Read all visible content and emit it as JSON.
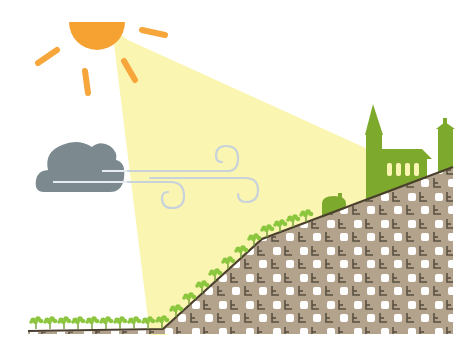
{
  "illustration": {
    "description": "Flat illustration of a sunny vineyard slope with wind, a cloud, and a village church on the hilltop",
    "colors": {
      "background": "#ffffff",
      "sun": "#F6A233",
      "sun_rays": "#F6A63A",
      "light_beam": "#FBF5B2",
      "cloud": "#7C8A90",
      "cloud_streak": "#E6ECEF",
      "wind": "#C8D2DA",
      "soil": "#B3A38D",
      "soil_square": "#FFFFFF",
      "soil_mark": "#5A5040",
      "ground_line": "#4A3F2E",
      "vine": "#8CC63E",
      "vine_stem": "#6F9A33",
      "buildings": "#7DAA2C"
    },
    "elements": [
      {
        "name": "sun",
        "type": "half-disc with rays"
      },
      {
        "name": "light-beam",
        "type": "sun ray polygon"
      },
      {
        "name": "cloud",
        "type": "grey cloud"
      },
      {
        "name": "wind",
        "type": "swirling wind lines"
      },
      {
        "name": "vineyard-slope",
        "type": "patterned hill"
      },
      {
        "name": "vines",
        "type": "row of vine plants"
      },
      {
        "name": "church",
        "type": "steepled church with 4 windows"
      },
      {
        "name": "tower",
        "type": "narrow tower"
      },
      {
        "name": "house",
        "type": "small house"
      }
    ],
    "church_window_count": 4
  }
}
